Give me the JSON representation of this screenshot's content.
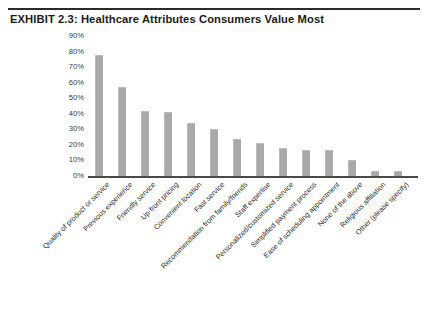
{
  "figure": {
    "exhibit_title": "EXHIBIT 2.3: Healthcare Attributes Consumers Value Most"
  },
  "chart_data": {
    "type": "bar",
    "title": "EXHIBIT 2.3: Healthcare Attributes Consumers Value Most",
    "xlabel": "",
    "ylabel": "",
    "ylim": [
      0,
      90
    ],
    "grid": false,
    "legend": "none",
    "orientation": "vertical",
    "bar_color": "#a9a9a9",
    "tick_labels_y": [
      "90%",
      "80%",
      "70%",
      "60%",
      "50%",
      "40%",
      "30%",
      "20%",
      "10%",
      "0%"
    ],
    "tick_values_y": [
      90,
      80,
      70,
      60,
      50,
      40,
      30,
      20,
      10,
      0
    ],
    "categories": [
      "Quality of product or service",
      "Previous experience",
      "Friendly service",
      "Up-front pricing",
      "Convenient location",
      "Fast service",
      "Recommendation from family/friends",
      "Staff expertise",
      "Personalized/customized service",
      "Simplified payment process",
      "Ease of scheduling appointment",
      "None of the above",
      "Religious affiliation",
      "Other (please specify)"
    ],
    "values": [
      78,
      57,
      42,
      41,
      34,
      30,
      24,
      21,
      18,
      17,
      17,
      10,
      3,
      3
    ]
  }
}
